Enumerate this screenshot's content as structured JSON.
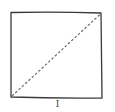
{
  "diagram": {
    "label": "I",
    "square": {
      "top_left": [
        11,
        12
      ],
      "top_right": [
        101,
        13
      ],
      "bottom_right": [
        102,
        98
      ],
      "bottom_left": [
        11,
        97
      ],
      "stroke": "#3a3a3a"
    },
    "diagonal": {
      "from": [
        12,
        96
      ],
      "to": [
        101,
        13
      ],
      "style": "dashed",
      "stroke": "#6a6a6a"
    }
  }
}
